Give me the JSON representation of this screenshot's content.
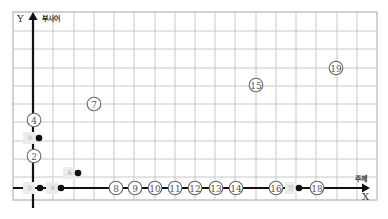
{
  "diagram": {
    "grid": {
      "left": 13,
      "right": 377,
      "top": 12,
      "bottom": 200,
      "col_xs": [
        13,
        33,
        53,
        74,
        94,
        114,
        134,
        155,
        175,
        195,
        215,
        235,
        256,
        276,
        296,
        316,
        337,
        357,
        377
      ],
      "row_ys": [
        12,
        31,
        49,
        68,
        86,
        104,
        122,
        141,
        159,
        177,
        200
      ],
      "line_color": "#c8c8c8"
    },
    "y_axis": {
      "x": 33,
      "from_y": 208,
      "to_y": 12,
      "label": "Y",
      "sublabel": "부사어"
    },
    "x_axis": {
      "y": 188,
      "from_x": 13,
      "to_x": 370,
      "label": "X",
      "sublabel": "주체"
    },
    "circled_nodes": [
      {
        "id": "2",
        "glyph": "②",
        "x": 34,
        "y": 156
      },
      {
        "id": "4",
        "glyph": "④",
        "x": 34,
        "y": 120
      },
      {
        "id": "7",
        "glyph": "⑦",
        "x": 94,
        "y": 104
      },
      {
        "id": "8",
        "glyph": "⑧",
        "x": 116,
        "y": 188
      },
      {
        "id": "9",
        "glyph": "⑨",
        "x": 135,
        "y": 188
      },
      {
        "id": "10",
        "glyph": "⑩",
        "x": 155,
        "y": 188
      },
      {
        "id": "11",
        "glyph": "⑪",
        "x": 175,
        "y": 188
      },
      {
        "id": "12",
        "glyph": "⑫",
        "x": 195,
        "y": 188
      },
      {
        "id": "13",
        "glyph": "⑬",
        "x": 216,
        "y": 188
      },
      {
        "id": "14",
        "glyph": "⑭",
        "x": 236,
        "y": 188
      },
      {
        "id": "15",
        "glyph": "⑮",
        "x": 256,
        "y": 85
      },
      {
        "id": "16",
        "glyph": "⑯",
        "x": 276,
        "y": 188
      },
      {
        "id": "18",
        "glyph": "⑱",
        "x": 317,
        "y": 188
      },
      {
        "id": "19",
        "glyph": "⑲",
        "x": 336,
        "y": 68
      }
    ],
    "dot_nodes": [
      {
        "id": "1",
        "glyph": "①",
        "tag_x": 29,
        "dot_x": 40,
        "y": 188
      },
      {
        "id": "3",
        "glyph": "③",
        "tag_x": 29,
        "dot_x": 39,
        "y": 138
      },
      {
        "id": "5",
        "glyph": "⑤",
        "tag_x": 52,
        "dot_x": 61,
        "y": 188
      },
      {
        "id": "6",
        "glyph": "⑥",
        "tag_x": 69,
        "dot_x": 78,
        "y": 173
      },
      {
        "id": "17",
        "glyph": "⑰",
        "tag_x": 291,
        "dot_x": 299,
        "y": 188
      }
    ]
  }
}
